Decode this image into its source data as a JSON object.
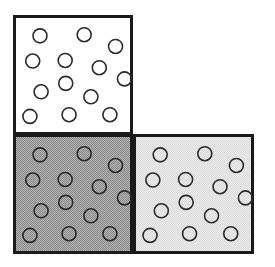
{
  "figure": {
    "name": "three-squares-particle-density-diagram",
    "canvas": {
      "width": 275,
      "height": 267,
      "background": "#ffffff"
    },
    "geometry": {
      "square_size": 120,
      "border_width": 3,
      "border_color": "#1a1a1a",
      "circle_diameter": 14,
      "circle_stroke_width": 1.6,
      "circle_stroke_color": "#2b2b2b",
      "circle_fill": "none"
    },
    "layout_description": "L-shaped arrangement of three equal squares: one upper-left, one lower-left, one lower-right; upper-right cell is empty white space.",
    "panels": [
      {
        "id": "top-left",
        "name": "panel-top-left",
        "x": 13,
        "y": 15,
        "width": 120,
        "height": 120,
        "fill": "#ffffff",
        "shade_label": "white",
        "circle_count": 13
      },
      {
        "id": "bottom-left",
        "name": "panel-bottom-left",
        "x": 13,
        "y": 134,
        "width": 120,
        "height": 120,
        "fill": "#9b9b9b",
        "shade_label": "medium gray",
        "circle_count": 13
      },
      {
        "id": "bottom-right",
        "name": "panel-bottom-right",
        "x": 133,
        "y": 134,
        "width": 121,
        "height": 120,
        "fill": "#e4e4e4",
        "shade_label": "light gray",
        "circle_count": 13
      }
    ],
    "circle_positions_normalized": [
      {
        "cx": 0.205,
        "cy": 0.15
      },
      {
        "cx": 0.6,
        "cy": 0.14
      },
      {
        "cx": 0.88,
        "cy": 0.245
      },
      {
        "cx": 0.14,
        "cy": 0.375
      },
      {
        "cx": 0.43,
        "cy": 0.37
      },
      {
        "cx": 0.735,
        "cy": 0.435
      },
      {
        "cx": 0.96,
        "cy": 0.535
      },
      {
        "cx": 0.435,
        "cy": 0.575
      },
      {
        "cx": 0.215,
        "cy": 0.65
      },
      {
        "cx": 0.66,
        "cy": 0.695
      },
      {
        "cx": 0.115,
        "cy": 0.87
      },
      {
        "cx": 0.465,
        "cy": 0.855
      },
      {
        "cx": 0.83,
        "cy": 0.855
      }
    ]
  }
}
